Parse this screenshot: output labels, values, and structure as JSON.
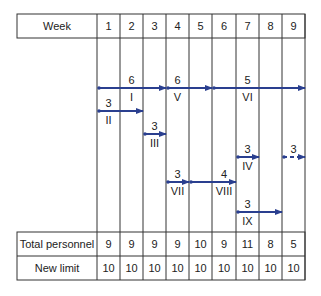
{
  "header": {
    "label": "Week",
    "weeks": [
      "1",
      "2",
      "3",
      "4",
      "5",
      "6",
      "7",
      "8",
      "9"
    ]
  },
  "activities": [
    {
      "id": "I",
      "personnel": "6",
      "start_week": 1,
      "end_week": 3,
      "row": 0,
      "style": "solid"
    },
    {
      "id": "V",
      "personnel": "6",
      "start_week": 4,
      "end_week": 5,
      "row": 0,
      "style": "solid"
    },
    {
      "id": "VI",
      "personnel": "5",
      "start_week": 6,
      "end_week": 9,
      "row": 0,
      "style": "solid"
    },
    {
      "id": "II",
      "personnel": "3",
      "start_week": 1,
      "end_week": 2,
      "row": 1,
      "style": "solid"
    },
    {
      "id": "III",
      "personnel": "3",
      "start_week": 3,
      "end_week": 3,
      "row": 2,
      "style": "solid"
    },
    {
      "id": "IV",
      "personnel": "3",
      "start_week": 7,
      "end_week": 7,
      "row": 3,
      "style": "solid"
    },
    {
      "id": "",
      "personnel": "3",
      "start_week": 9,
      "end_week": 9,
      "row": 3,
      "style": "dashed"
    },
    {
      "id": "VII",
      "personnel": "3",
      "start_week": 4,
      "end_week": 4,
      "row": 4,
      "style": "solid"
    },
    {
      "id": "VIII",
      "personnel": "4",
      "start_week": 5,
      "end_week": 6,
      "row": 4,
      "style": "solid"
    },
    {
      "id": "IX",
      "personnel": "3",
      "start_week": 7,
      "end_week": 8,
      "row": 5,
      "style": "solid"
    }
  ],
  "rows": [
    {
      "label": "Total personnel",
      "values": [
        "9",
        "9",
        "9",
        "9",
        "10",
        "9",
        "11",
        "8",
        "5"
      ]
    },
    {
      "label": "New limit",
      "values": [
        "10",
        "10",
        "10",
        "10",
        "10",
        "10",
        "10",
        "10",
        "10"
      ]
    }
  ],
  "colors": {
    "arrow": "#2a3f8f",
    "grid": "#333333"
  }
}
